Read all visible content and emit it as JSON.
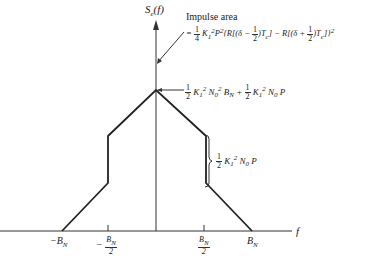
{
  "figure": {
    "y_axis_label": "S_e(f)",
    "x_axis_label": "f",
    "impulse_title": "Impulse area",
    "impulse_formula": "= 1/4 K1^2 P^2 {R[(δ − 1/2)Tc] − R[(δ + 1/2)Tc]}^2",
    "peak_label": "1/2 K1^2 N0^2 BN + 1/2 K1^2 N0 P",
    "step_label": "1/2 K1^2 N0 P",
    "x_ticks": [
      "-B_N",
      "-B_N/2",
      "B_N/2",
      "B_N"
    ]
  }
}
